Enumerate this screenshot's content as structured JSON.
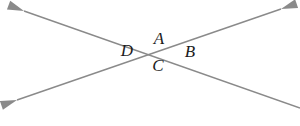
{
  "figure": {
    "background_color": "#ffffff",
    "line_color": "#8a8a8a",
    "label_color": "#1c1c1c",
    "line_width": 1.4,
    "width": 300,
    "height": 126,
    "intersection": {
      "x": 157,
      "y": 51
    },
    "lines": [
      {
        "id": "line-descending",
        "name": "line-upper-left-to-lower-right",
        "x1": 24,
        "y1": 11,
        "x2": 300,
        "y2": 108,
        "start_arrow": true,
        "end_arrow": false
      },
      {
        "id": "line-ascending",
        "name": "line-lower-left-to-upper-right",
        "x1": 17,
        "y1": 100,
        "x2": 281,
        "y2": 9,
        "start_arrow": true,
        "end_arrow": true
      }
    ],
    "arrowheads": [
      {
        "id": "arrow-upper-left",
        "x": 24,
        "y": 11,
        "angle": 201
      },
      {
        "id": "arrow-lower-left",
        "x": 17,
        "y": 100,
        "angle": 161
      },
      {
        "id": "arrow-upper-right",
        "x": 281,
        "y": 9,
        "angle": 341
      }
    ],
    "labels": [
      {
        "id": "label-a",
        "text": "A",
        "x": 159,
        "y": 38
      },
      {
        "id": "label-d",
        "text": "D",
        "x": 127,
        "y": 50
      },
      {
        "id": "label-b",
        "text": "B",
        "x": 190,
        "y": 51
      },
      {
        "id": "label-c",
        "text": "C",
        "x": 158,
        "y": 65
      }
    ]
  }
}
